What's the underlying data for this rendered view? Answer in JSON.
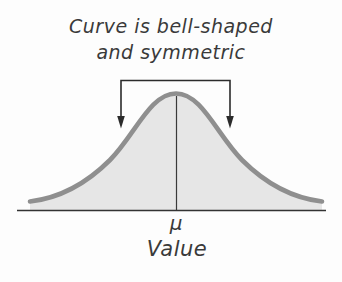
{
  "figure": {
    "annotation": {
      "line1": "Curve is bell-shaped",
      "line2": "and symmetric"
    },
    "mean_label": "μ",
    "axis_label": "Value",
    "colors": {
      "background": "#fdfdfd",
      "curve_stroke": "#8f8f8f",
      "curve_fill": "#e6e6e6",
      "annotation_line": "#2b2b2b",
      "axis": "#333333",
      "text": "#3a3a3a"
    }
  }
}
